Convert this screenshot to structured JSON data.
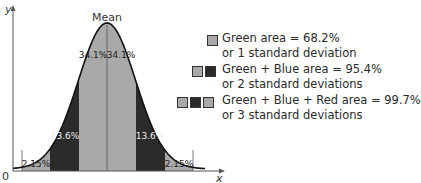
{
  "chart_data": {
    "type": "area",
    "xlabel": "x",
    "ylabel": "y",
    "origin_label": "0",
    "peak_label": "Mean",
    "regions": [
      {
        "label": "2.15%",
        "value": 2.15,
        "band": "-3σ to -2σ",
        "color": "#a9a9a9"
      },
      {
        "label": "13.6%",
        "value": 13.6,
        "band": "-2σ to -1σ",
        "color": "#2b2b2b"
      },
      {
        "label": "34.1%",
        "value": 34.1,
        "band": "-1σ to mean",
        "color": "#a9a9a9"
      },
      {
        "label": "34.1%",
        "value": 34.1,
        "band": "mean to +1σ",
        "color": "#a9a9a9"
      },
      {
        "label": "13.6%",
        "value": 13.6,
        "band": "+1σ to +2σ",
        "color": "#2b2b2b"
      },
      {
        "label": "2.15%",
        "value": 2.15,
        "band": "+2σ to +3σ",
        "color": "#a9a9a9"
      }
    ],
    "legend": [
      {
        "line1": "Green area = 68.2%",
        "line2": "or 1 standard deviation",
        "value": 68.2,
        "swatches": [
          "#a9a9a9"
        ]
      },
      {
        "line1": "Green + Blue area = 95.4%",
        "line2": "or 2 standard deviations",
        "value": 95.4,
        "swatches": [
          "#a9a9a9",
          "#2b2b2b"
        ]
      },
      {
        "line1": "Green + Blue + Red area = 99.7%",
        "line2": "or 3 standard deviations",
        "value": 99.7,
        "swatches": [
          "#a9a9a9",
          "#2b2b2b",
          "#a9a9a9"
        ]
      }
    ],
    "legend_position": "right",
    "grid": false
  },
  "colors": {
    "inner": "#a9a9a9",
    "middle": "#2b2b2b",
    "outer": "#a9a9a9",
    "axis": "#555555",
    "curve": "#111111"
  }
}
